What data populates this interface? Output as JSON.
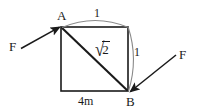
{
  "figure": {
    "type": "geometry-diagram",
    "vertices": {
      "top_left_label": "A",
      "bottom_right_label": "B"
    },
    "forces": {
      "left_label": "F",
      "right_label": "F"
    },
    "lengths": {
      "top_arc": "1",
      "right_arc": "1",
      "diagonal_radical": "√",
      "diagonal_radicand": "2",
      "base": "4m"
    },
    "colors": {
      "stroke": "#1a1a1a",
      "arc_stroke": "#7a7a7a",
      "background": "#ffffff"
    }
  }
}
